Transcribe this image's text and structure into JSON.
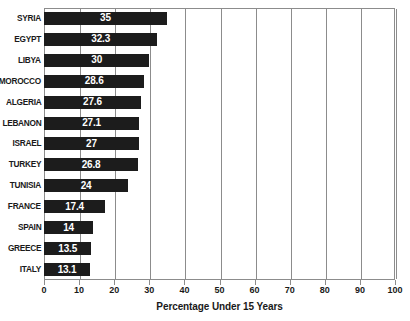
{
  "chart_data": {
    "type": "bar",
    "orientation": "horizontal",
    "title": "",
    "subtitle": "",
    "xlabel": "Percentage Under 15 Years",
    "ylabel": "",
    "xlim": [
      0,
      100
    ],
    "xticks": [
      0,
      10,
      20,
      30,
      40,
      50,
      60,
      70,
      80,
      90,
      100
    ],
    "grid": true,
    "grid_axis": "x",
    "legend": false,
    "legend_position": "none",
    "bar_color": "#1c1c1c",
    "value_label_color": "#ffffff",
    "categories": [
      "SYRIA",
      "EGYPT",
      "LIBYA",
      "MOROCCO",
      "ALGERIA",
      "LEBANON",
      "ISRAEL",
      "TURKEY",
      "TUNISIA",
      "FRANCE",
      "SPAIN",
      "GREECE",
      "ITALY"
    ],
    "values": [
      35,
      32.3,
      30,
      28.6,
      27.6,
      27.1,
      27,
      26.8,
      24,
      17.4,
      14,
      13.5,
      13.1
    ],
    "value_labels": [
      "35",
      "32.3",
      "30",
      "28.6",
      "27.6",
      "27.1",
      "27",
      "26.8",
      "24",
      "17.4",
      "14",
      "13.5",
      "13.1"
    ]
  },
  "axis": {
    "x_title": "Percentage Under 15 Years",
    "tick_labels": [
      "0",
      "10",
      "20",
      "30",
      "40",
      "50",
      "60",
      "70",
      "80",
      "90",
      "100"
    ]
  }
}
